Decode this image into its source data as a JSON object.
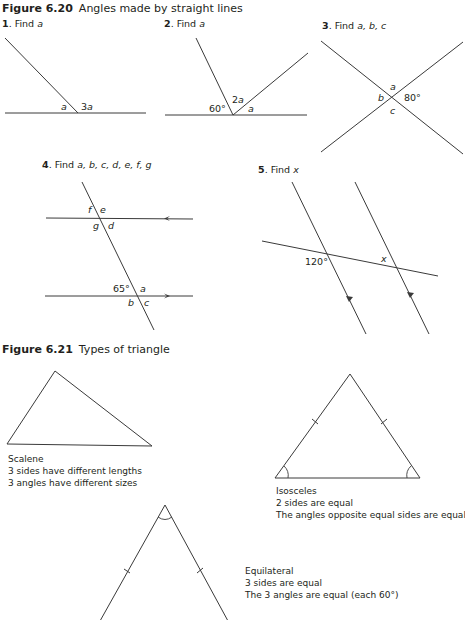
{
  "figure_620": {
    "number": "Figure 6.20",
    "title": "Angles made by straight lines",
    "problems": [
      {
        "num": "1",
        "prompt": "Find",
        "vars": "a",
        "labels": {
          "a": "a",
          "b": "3a"
        }
      },
      {
        "num": "2",
        "prompt": "Find",
        "vars": "a",
        "labels": {
          "deg": "60°",
          "two_a": "2a",
          "a": "a"
        }
      },
      {
        "num": "3",
        "prompt": "Find",
        "vars": "a, b, c",
        "labels": {
          "a": "a",
          "b": "b",
          "deg": "80°",
          "c": "c"
        }
      },
      {
        "num": "4",
        "prompt": "Find",
        "vars": "a, b, c, d, e, f, g",
        "labels": {
          "f": "f",
          "e": "e",
          "g": "g",
          "d": "d",
          "deg": "65°",
          "a": "a",
          "b": "b",
          "c": "c"
        }
      },
      {
        "num": "5",
        "prompt": "Find",
        "vars": "x",
        "labels": {
          "deg": "120°",
          "x": "x"
        }
      }
    ]
  },
  "figure_621": {
    "number": "Figure 6.21",
    "title": "Types of triangle",
    "triangles": [
      {
        "name": "Scalene",
        "lines": [
          "3 sides have different lengths",
          "3 angles have different sizes"
        ]
      },
      {
        "name": "Isosceles",
        "lines": [
          "2 sides are equal",
          "The angles opposite equal sides are equal"
        ]
      },
      {
        "name": "Equilateral",
        "lines": [
          "3 sides are equal",
          "The 3 angles are equal (each 60°)"
        ]
      }
    ]
  }
}
